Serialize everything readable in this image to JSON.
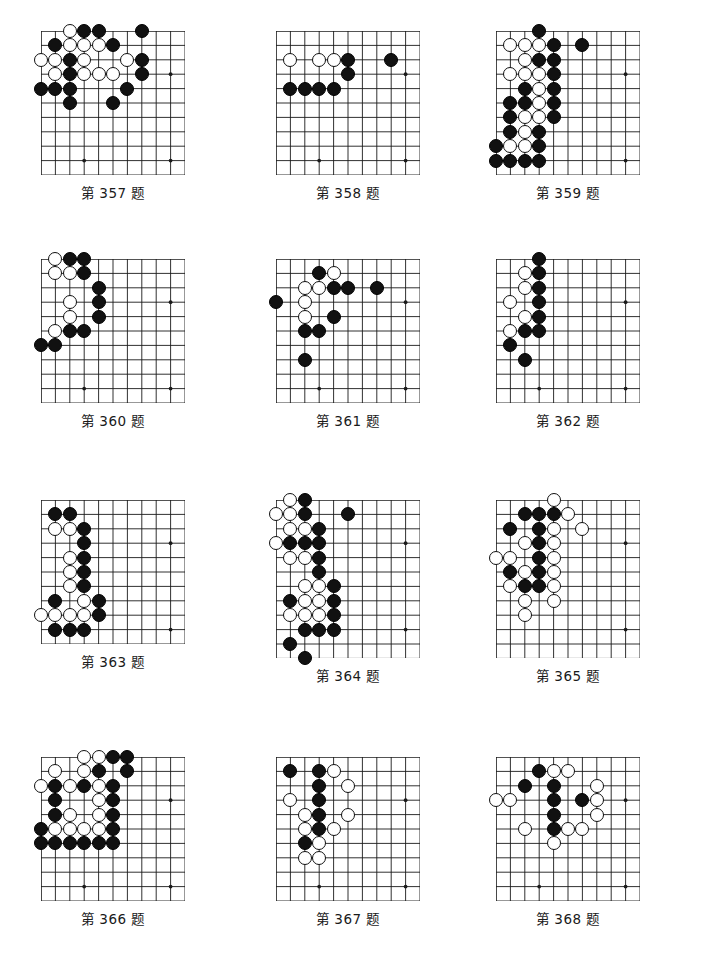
{
  "page": {
    "kind": "go-problem-sheet",
    "width": 701,
    "height": 970,
    "background": "#ffffff",
    "ink": "#111111",
    "grid_line_color": "#1a1a1a",
    "stone_black_color": "#111111",
    "stone_white_color": "#ffffff"
  },
  "layout": {
    "columns": 3,
    "rows": 4,
    "cell_size": 14.4,
    "stone_diameter": 14.2,
    "col_x": [
      41,
      276,
      496
    ],
    "row_y": [
      31,
      259,
      500,
      757
    ],
    "caption_gap": 7
  },
  "diagrams": [
    {
      "id": "d357",
      "caption": "第 357 题",
      "cols": 11,
      "rows": 11,
      "star_points": [
        [
          9,
          3
        ],
        [
          3,
          9
        ],
        [
          9,
          9
        ]
      ],
      "black": [
        [
          3,
          0
        ],
        [
          4,
          0
        ],
        [
          7,
          0
        ],
        [
          1,
          1
        ],
        [
          5,
          1
        ],
        [
          2,
          2
        ],
        [
          7,
          2
        ],
        [
          2,
          3
        ],
        [
          7,
          3
        ],
        [
          0,
          4
        ],
        [
          1,
          4
        ],
        [
          2,
          4
        ],
        [
          6,
          4
        ],
        [
          2,
          5
        ],
        [
          5,
          5
        ]
      ],
      "white": [
        [
          2,
          0
        ],
        [
          2,
          1
        ],
        [
          3,
          1
        ],
        [
          4,
          1
        ],
        [
          0,
          2
        ],
        [
          1,
          2
        ],
        [
          3,
          2
        ],
        [
          6,
          2
        ],
        [
          1,
          3
        ],
        [
          3,
          3
        ],
        [
          4,
          3
        ],
        [
          5,
          3
        ]
      ]
    },
    {
      "id": "d358",
      "caption": "第 358 题",
      "cols": 11,
      "rows": 11,
      "star_points": [
        [
          9,
          3
        ],
        [
          3,
          9
        ],
        [
          9,
          9
        ]
      ],
      "black": [
        [
          5,
          2
        ],
        [
          8,
          2
        ],
        [
          5,
          3
        ],
        [
          1,
          4
        ],
        [
          2,
          4
        ],
        [
          3,
          4
        ],
        [
          4,
          4
        ]
      ],
      "white": [
        [
          1,
          2
        ],
        [
          3,
          2
        ],
        [
          4,
          2
        ]
      ]
    },
    {
      "id": "d359",
      "caption": "第 359 题",
      "cols": 11,
      "rows": 11,
      "star_points": [
        [
          9,
          3
        ],
        [
          9,
          9
        ]
      ],
      "black": [
        [
          3,
          0
        ],
        [
          4,
          1
        ],
        [
          6,
          1
        ],
        [
          3,
          2
        ],
        [
          4,
          2
        ],
        [
          4,
          3
        ],
        [
          2,
          4
        ],
        [
          4,
          4
        ],
        [
          1,
          5
        ],
        [
          2,
          5
        ],
        [
          4,
          5
        ],
        [
          1,
          6
        ],
        [
          4,
          6
        ],
        [
          1,
          7
        ],
        [
          3,
          7
        ],
        [
          0,
          8
        ],
        [
          3,
          8
        ],
        [
          0,
          9
        ],
        [
          1,
          9
        ],
        [
          2,
          9
        ],
        [
          3,
          9
        ]
      ],
      "white": [
        [
          1,
          1
        ],
        [
          2,
          1
        ],
        [
          3,
          1
        ],
        [
          2,
          2
        ],
        [
          1,
          3
        ],
        [
          2,
          3
        ],
        [
          3,
          3
        ],
        [
          3,
          4
        ],
        [
          3,
          5
        ],
        [
          2,
          6
        ],
        [
          3,
          6
        ],
        [
          2,
          7
        ],
        [
          1,
          8
        ],
        [
          2,
          8
        ]
      ]
    },
    {
      "id": "d360",
      "caption": "第 360 题",
      "cols": 11,
      "rows": 11,
      "star_points": [
        [
          9,
          3
        ],
        [
          3,
          9
        ],
        [
          9,
          9
        ]
      ],
      "black": [
        [
          2,
          0
        ],
        [
          3,
          0
        ],
        [
          3,
          1
        ],
        [
          4,
          2
        ],
        [
          4,
          3
        ],
        [
          4,
          4
        ],
        [
          2,
          5
        ],
        [
          3,
          5
        ],
        [
          0,
          6
        ],
        [
          1,
          6
        ]
      ],
      "white": [
        [
          1,
          0
        ],
        [
          1,
          1
        ],
        [
          2,
          1
        ],
        [
          2,
          3
        ],
        [
          2,
          4
        ],
        [
          1,
          5
        ]
      ]
    },
    {
      "id": "d361",
      "caption": "第 361 题",
      "cols": 11,
      "rows": 11,
      "star_points": [
        [
          9,
          3
        ],
        [
          3,
          9
        ],
        [
          9,
          9
        ]
      ],
      "black": [
        [
          3,
          1
        ],
        [
          4,
          2
        ],
        [
          5,
          2
        ],
        [
          7,
          2
        ],
        [
          0,
          3
        ],
        [
          4,
          4
        ],
        [
          2,
          5
        ],
        [
          3,
          5
        ],
        [
          2,
          7
        ]
      ],
      "white": [
        [
          4,
          1
        ],
        [
          2,
          2
        ],
        [
          3,
          2
        ],
        [
          2,
          3
        ],
        [
          2,
          4
        ]
      ]
    },
    {
      "id": "d362",
      "caption": "第 362 题",
      "cols": 11,
      "rows": 11,
      "star_points": [
        [
          9,
          3
        ],
        [
          3,
          9
        ],
        [
          9,
          9
        ]
      ],
      "black": [
        [
          3,
          0
        ],
        [
          3,
          1
        ],
        [
          3,
          2
        ],
        [
          3,
          3
        ],
        [
          3,
          4
        ],
        [
          2,
          5
        ],
        [
          3,
          5
        ],
        [
          1,
          6
        ],
        [
          2,
          7
        ]
      ],
      "white": [
        [
          2,
          1
        ],
        [
          2,
          2
        ],
        [
          1,
          3
        ],
        [
          2,
          4
        ],
        [
          1,
          5
        ]
      ]
    },
    {
      "id": "d363",
      "caption": "第 363 题",
      "cols": 11,
      "rows": 11,
      "star_points": [
        [
          9,
          3
        ],
        [
          9,
          9
        ]
      ],
      "black": [
        [
          1,
          1
        ],
        [
          2,
          1
        ],
        [
          3,
          2
        ],
        [
          3,
          3
        ],
        [
          3,
          4
        ],
        [
          3,
          5
        ],
        [
          3,
          6
        ],
        [
          1,
          7
        ],
        [
          4,
          7
        ],
        [
          4,
          8
        ],
        [
          1,
          9
        ],
        [
          2,
          9
        ],
        [
          3,
          9
        ]
      ],
      "white": [
        [
          1,
          2
        ],
        [
          2,
          2
        ],
        [
          2,
          4
        ],
        [
          2,
          5
        ],
        [
          2,
          6
        ],
        [
          3,
          7
        ],
        [
          0,
          8
        ],
        [
          1,
          8
        ],
        [
          2,
          8
        ],
        [
          3,
          8
        ]
      ]
    },
    {
      "id": "d364",
      "caption": "第 364 题",
      "cols": 11,
      "rows": 12,
      "star_points": [
        [
          9,
          3
        ],
        [
          9,
          9
        ]
      ],
      "black": [
        [
          2,
          0
        ],
        [
          2,
          1
        ],
        [
          5,
          1
        ],
        [
          3,
          2
        ],
        [
          1,
          3
        ],
        [
          2,
          3
        ],
        [
          3,
          3
        ],
        [
          3,
          4
        ],
        [
          3,
          5
        ],
        [
          4,
          6
        ],
        [
          1,
          7
        ],
        [
          4,
          7
        ],
        [
          4,
          8
        ],
        [
          2,
          9
        ],
        [
          3,
          9
        ],
        [
          4,
          9
        ],
        [
          1,
          10
        ],
        [
          2,
          11
        ]
      ],
      "white": [
        [
          1,
          0
        ],
        [
          0,
          1
        ],
        [
          1,
          1
        ],
        [
          1,
          2
        ],
        [
          2,
          2
        ],
        [
          0,
          3
        ],
        [
          1,
          4
        ],
        [
          2,
          4
        ],
        [
          2,
          6
        ],
        [
          3,
          6
        ],
        [
          2,
          7
        ],
        [
          3,
          7
        ],
        [
          1,
          8
        ],
        [
          2,
          8
        ],
        [
          3,
          8
        ]
      ]
    },
    {
      "id": "d365",
      "caption": "第 365 题",
      "cols": 11,
      "rows": 12,
      "star_points": [
        [
          9,
          3
        ],
        [
          9,
          9
        ]
      ],
      "black": [
        [
          2,
          1
        ],
        [
          3,
          1
        ],
        [
          4,
          1
        ],
        [
          1,
          2
        ],
        [
          3,
          2
        ],
        [
          3,
          3
        ],
        [
          3,
          4
        ],
        [
          1,
          5
        ],
        [
          3,
          5
        ],
        [
          2,
          6
        ],
        [
          3,
          6
        ]
      ],
      "white": [
        [
          4,
          0
        ],
        [
          5,
          1
        ],
        [
          4,
          2
        ],
        [
          6,
          2
        ],
        [
          2,
          3
        ],
        [
          4,
          3
        ],
        [
          0,
          4
        ],
        [
          1,
          4
        ],
        [
          4,
          4
        ],
        [
          2,
          5
        ],
        [
          4,
          5
        ],
        [
          1,
          6
        ],
        [
          4,
          6
        ],
        [
          2,
          7
        ],
        [
          4,
          7
        ],
        [
          2,
          8
        ]
      ]
    },
    {
      "id": "d366",
      "caption": "第 366 题",
      "cols": 11,
      "rows": 11,
      "star_points": [
        [
          9,
          3
        ],
        [
          3,
          9
        ],
        [
          9,
          9
        ]
      ],
      "black": [
        [
          5,
          0
        ],
        [
          6,
          0
        ],
        [
          4,
          1
        ],
        [
          6,
          1
        ],
        [
          1,
          2
        ],
        [
          3,
          2
        ],
        [
          5,
          2
        ],
        [
          1,
          3
        ],
        [
          5,
          3
        ],
        [
          1,
          4
        ],
        [
          5,
          4
        ],
        [
          0,
          5
        ],
        [
          5,
          5
        ],
        [
          0,
          6
        ],
        [
          1,
          6
        ],
        [
          2,
          6
        ],
        [
          3,
          6
        ],
        [
          4,
          6
        ],
        [
          5,
          6
        ]
      ],
      "white": [
        [
          3,
          0
        ],
        [
          4,
          0
        ],
        [
          1,
          1
        ],
        [
          3,
          1
        ],
        [
          0,
          2
        ],
        [
          2,
          2
        ],
        [
          4,
          2
        ],
        [
          4,
          3
        ],
        [
          2,
          4
        ],
        [
          4,
          4
        ],
        [
          1,
          5
        ],
        [
          2,
          5
        ],
        [
          3,
          5
        ],
        [
          4,
          5
        ]
      ]
    },
    {
      "id": "d367",
      "caption": "第 367 题",
      "cols": 11,
      "rows": 11,
      "star_points": [
        [
          9,
          3
        ],
        [
          3,
          9
        ],
        [
          9,
          9
        ]
      ],
      "black": [
        [
          1,
          1
        ],
        [
          3,
          1
        ],
        [
          3,
          2
        ],
        [
          3,
          3
        ],
        [
          3,
          4
        ],
        [
          3,
          5
        ],
        [
          2,
          6
        ]
      ],
      "white": [
        [
          4,
          1
        ],
        [
          5,
          2
        ],
        [
          1,
          3
        ],
        [
          2,
          4
        ],
        [
          5,
          4
        ],
        [
          2,
          5
        ],
        [
          4,
          5
        ],
        [
          3,
          6
        ],
        [
          2,
          7
        ],
        [
          3,
          7
        ]
      ]
    },
    {
      "id": "d368",
      "caption": "第 368 题",
      "cols": 11,
      "rows": 11,
      "star_points": [
        [
          9,
          3
        ],
        [
          3,
          9
        ],
        [
          9,
          9
        ]
      ],
      "black": [
        [
          3,
          1
        ],
        [
          2,
          2
        ],
        [
          4,
          2
        ],
        [
          4,
          3
        ],
        [
          6,
          3
        ],
        [
          4,
          4
        ],
        [
          4,
          5
        ]
      ],
      "white": [
        [
          4,
          1
        ],
        [
          5,
          1
        ],
        [
          7,
          2
        ],
        [
          0,
          3
        ],
        [
          1,
          3
        ],
        [
          7,
          3
        ],
        [
          7,
          4
        ],
        [
          2,
          5
        ],
        [
          5,
          5
        ],
        [
          6,
          5
        ],
        [
          4,
          6
        ]
      ]
    }
  ]
}
